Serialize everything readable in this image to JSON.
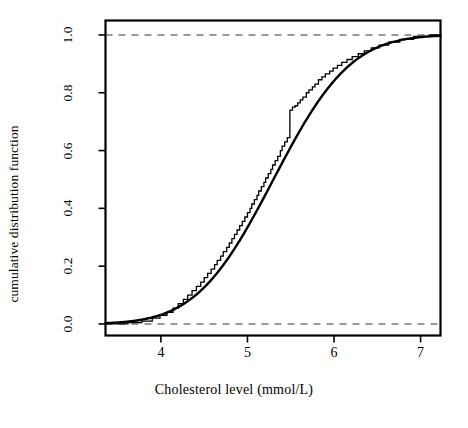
{
  "figure": {
    "background": "#ffffff",
    "box_color": "#000000",
    "reference_line_color": "#9a9a9a",
    "curve_color": "#000000"
  },
  "chart_data": {
    "type": "line",
    "title": "",
    "subtitle": "",
    "xlabel": "Cholesterol level (mmol/L)",
    "ylabel": "cumulative distribution function",
    "xlim": [
      3.36,
      7.23
    ],
    "ylim": [
      -0.04,
      1.05
    ],
    "xticks": [
      4,
      5,
      6,
      7
    ],
    "xtick_labels": [
      "4",
      "5",
      "6",
      "7"
    ],
    "yticks": [
      0.0,
      0.2,
      0.4,
      0.6,
      0.8,
      1.0
    ],
    "ytick_labels": [
      "0.0",
      "0.2",
      "0.4",
      "0.6",
      "0.8",
      "1.0"
    ],
    "grid": false,
    "legend": null,
    "annotations": [],
    "reference_lines": [
      {
        "orientation": "horizontal",
        "y": 0.0,
        "style": "dashed",
        "color": "#9a9a9a"
      },
      {
        "orientation": "horizontal",
        "y": 1.0,
        "style": "dashed",
        "color": "#9a9a9a"
      }
    ],
    "series": [
      {
        "name": "empirical cumulative distribution function",
        "type": "step",
        "color": "#000000",
        "x": [
          3.4,
          3.62,
          3.78,
          3.9,
          3.99,
          4.07,
          4.14,
          4.2,
          4.26,
          4.31,
          4.36,
          4.41,
          4.46,
          4.5,
          4.54,
          4.58,
          4.62,
          4.65,
          4.69,
          4.72,
          4.76,
          4.79,
          4.82,
          4.85,
          4.88,
          4.91,
          4.94,
          4.97,
          5.0,
          5.03,
          5.05,
          5.08,
          5.11,
          5.13,
          5.16,
          5.19,
          5.21,
          5.24,
          5.27,
          5.29,
          5.32,
          5.35,
          5.38,
          5.4,
          5.43,
          5.46,
          5.49,
          5.52,
          5.55,
          5.58,
          5.61,
          5.64,
          5.68,
          5.71,
          5.75,
          5.78,
          5.82,
          5.86,
          5.9,
          5.95,
          5.99,
          6.04,
          6.09,
          6.15,
          6.21,
          6.28,
          6.35,
          6.43,
          6.52,
          6.63,
          6.76,
          6.92,
          7.1,
          7.2
        ],
        "y": [
          0.0,
          0.005,
          0.01,
          0.02,
          0.03,
          0.04,
          0.055,
          0.07,
          0.085,
          0.1,
          0.115,
          0.13,
          0.145,
          0.16,
          0.175,
          0.19,
          0.205,
          0.22,
          0.235,
          0.25,
          0.265,
          0.28,
          0.295,
          0.31,
          0.325,
          0.34,
          0.355,
          0.37,
          0.385,
          0.4,
          0.415,
          0.43,
          0.445,
          0.46,
          0.475,
          0.49,
          0.505,
          0.52,
          0.535,
          0.55,
          0.565,
          0.58,
          0.6,
          0.615,
          0.63,
          0.645,
          0.74,
          0.75,
          0.755,
          0.765,
          0.775,
          0.785,
          0.8,
          0.81,
          0.82,
          0.83,
          0.845,
          0.855,
          0.865,
          0.875,
          0.885,
          0.895,
          0.905,
          0.915,
          0.925,
          0.935,
          0.945,
          0.955,
          0.965,
          0.975,
          0.985,
          0.995,
          1.0,
          1.0
        ]
      },
      {
        "name": "fitted normal cumulative distribution function",
        "type": "line",
        "color": "#000000",
        "distribution": "normal",
        "mean": 5.3,
        "sd": 0.7
      }
    ]
  },
  "labels": {
    "y_axis_title": "cumulative distribution function",
    "x_axis_title": "Cholesterol level (mmol/L)"
  }
}
